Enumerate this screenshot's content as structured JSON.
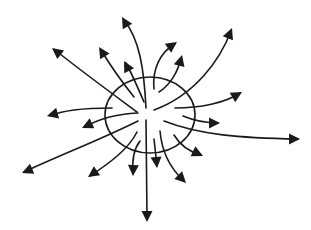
{
  "diagram": {
    "stroke_color": "#1a1a1a",
    "background": "#ffffff",
    "ellipse": {
      "cx": 150,
      "cy": 115,
      "rx": 45,
      "ry": 38
    },
    "arrows": [
      {
        "id": "up-long",
        "d": "M146,108 C144,70 140,40 124,20",
        "tip": [
          122,
          17
        ],
        "angle": -120
      },
      {
        "id": "up-left-long",
        "d": "M137,112 C110,92 80,70 55,50",
        "tip": [
          52,
          48
        ],
        "angle": -142
      },
      {
        "id": "up-left",
        "d": "M134,97 C122,82 110,65 101,50",
        "tip": [
          99,
          47
        ],
        "angle": -122
      },
      {
        "id": "up-left-inner",
        "d": "M144,102 C138,88 132,74 126,63",
        "tip": [
          124,
          61
        ],
        "angle": -118
      },
      {
        "id": "left",
        "d": "M112,108 C90,108 65,109 50,116",
        "tip": [
          47,
          116
        ],
        "angle": 165
      },
      {
        "id": "left-lower",
        "d": "M138,113 C118,114 100,118 85,127",
        "tip": [
          82,
          128
        ],
        "angle": 155
      },
      {
        "id": "down-left-long",
        "d": "M138,121 C100,140 60,155 24,172",
        "tip": [
          22,
          173
        ],
        "angle": 157
      },
      {
        "id": "down-left",
        "d": "M137,132 C128,150 108,164 90,176",
        "tip": [
          88,
          177
        ],
        "angle": 145
      },
      {
        "id": "down-short-left",
        "d": "M140,141 C133,150 132,162 133,174",
        "tip": [
          133,
          176
        ],
        "angle": 92
      },
      {
        "id": "down-long",
        "d": "M146,120 L147,218",
        "tip": [
          147,
          222
        ],
        "angle": 90
      },
      {
        "id": "down-short-right",
        "d": "M154,139 L157,166",
        "tip": [
          157,
          168
        ],
        "angle": 85
      },
      {
        "id": "down-right",
        "d": "M160,131 C162,155 172,170 184,181",
        "tip": [
          186,
          183
        ],
        "angle": 45
      },
      {
        "id": "right-lower",
        "d": "M174,135 C180,145 190,152 201,155",
        "tip": [
          203,
          156
        ],
        "angle": 25
      },
      {
        "id": "right-long",
        "d": "M164,121 C200,135 240,138 298,139",
        "tip": [
          300,
          139
        ],
        "angle": 0
      },
      {
        "id": "right-short",
        "d": "M183,116 C195,121 205,123 218,123",
        "tip": [
          220,
          123
        ],
        "angle": 0
      },
      {
        "id": "right-upper",
        "d": "M175,108 C200,108 225,103 240,93",
        "tip": [
          242,
          92
        ],
        "angle": -30
      },
      {
        "id": "up-right-long",
        "d": "M154,110 C195,95 220,60 231,31",
        "tip": [
          232,
          28
        ],
        "angle": -68
      },
      {
        "id": "up-right-inner",
        "d": "M159,92 C170,85 178,72 181,58",
        "tip": [
          182,
          55
        ],
        "angle": -75
      },
      {
        "id": "up-right",
        "d": "M154,89 C152,70 160,52 175,44",
        "tip": [
          177,
          42
        ],
        "angle": -35
      }
    ]
  }
}
